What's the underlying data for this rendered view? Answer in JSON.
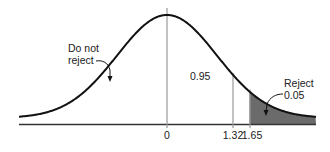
{
  "chart_data": {
    "type": "area",
    "title": "",
    "xlabel": "",
    "ylabel": "",
    "x_ticks": [
      {
        "value": 0,
        "label": "0"
      },
      {
        "value": 1.32,
        "label": "1.32"
      },
      {
        "value": 1.65,
        "label": "1.65"
      }
    ],
    "regions": [
      {
        "name": "Do not reject",
        "area": 0.95,
        "range": [
          null,
          1.65
        ],
        "shaded": false
      },
      {
        "name": "Reject",
        "area": 0.05,
        "range": [
          1.65,
          null
        ],
        "shaded": true
      }
    ],
    "annotations": [
      {
        "text": "Do not\nreject",
        "points_to": "left body of curve"
      },
      {
        "text": "0.95",
        "position": "between 0 and 1.32"
      },
      {
        "text": "Reject\n0.05",
        "points_to": "shaded tail beyond 1.65"
      }
    ],
    "vertical_lines": [
      0,
      1.32,
      1.65
    ],
    "xlim": [
      -2.2,
      2.2
    ],
    "grid": false,
    "legend": "none",
    "fill_color": "#6b6b6b",
    "line_color": "#111111"
  },
  "labels": {
    "do_not_reject_line1": "Do not",
    "do_not_reject_line2": "reject",
    "center_area": "0.95",
    "reject_line1": "Reject",
    "reject_line2": "0.05",
    "tick_0": "0",
    "tick_132": "1.32",
    "tick_165": "1.65"
  }
}
